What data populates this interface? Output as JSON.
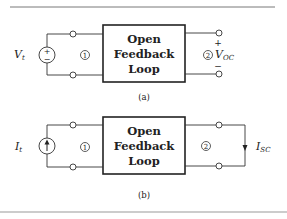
{
  "figure": {
    "panel_a": {
      "source_label": "V",
      "source_subscript": "t",
      "source_type": "voltage-source",
      "source_plus": "+",
      "source_minus": "−",
      "port1_label": "1",
      "port2_label": "2",
      "box_lines": [
        "Open",
        "Feedback",
        "Loop"
      ],
      "output_label": "V",
      "output_subscript": "OC",
      "output_plus": "+",
      "output_minus": "−",
      "caption": "(a)"
    },
    "panel_b": {
      "source_label": "I",
      "source_subscript": "t",
      "source_type": "current-source",
      "port1_label": "1",
      "port2_label": "2",
      "box_lines": [
        "Open",
        "Feedback",
        "Loop"
      ],
      "output_label": "I",
      "output_subscript": "SC",
      "caption": "(b)"
    }
  }
}
